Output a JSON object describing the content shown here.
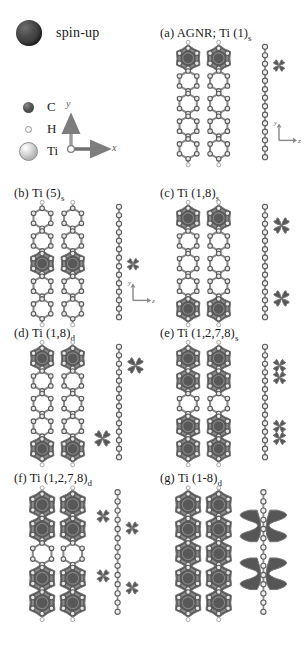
{
  "legend": {
    "spin_up_label": "spin-up",
    "atoms": [
      {
        "symbol": "C",
        "name": "carbon-marker"
      },
      {
        "symbol": "H",
        "name": "hydrogen-marker"
      },
      {
        "symbol": "Ti",
        "name": "titanium-marker"
      }
    ],
    "axes_main": {
      "x": "x",
      "y": "y"
    },
    "axes_side": {
      "y": "y",
      "z": "z"
    }
  },
  "colors": {
    "spin_density": "#4a4a4a",
    "spin_density_edge": "#6d6d6d",
    "carbon": "#4f4f4f",
    "hydrogen": "#f0f0f0",
    "titanium": "#c9c9c9",
    "bond": "#8a8a8a",
    "background": "#ffffff"
  },
  "panels": [
    {
      "id": "a",
      "tag": "(a)",
      "title_main": "AGNR; Ti (1)",
      "title_sub": "s",
      "full_label": "(a) AGNR; Ti (1)s",
      "ti_sites": [
        1
      ],
      "coupling": "s",
      "top_view_name": "top-view-a",
      "side_view_name": "side-view-a",
      "show_side_axes": true,
      "spin_positions_top": [
        {
          "col": 0,
          "row": 0
        },
        {
          "col": 1,
          "row": 0
        }
      ],
      "side_lobes": [
        {
          "y": 0.17,
          "side": "right",
          "size": "small"
        }
      ]
    },
    {
      "id": "b",
      "tag": "(b)",
      "title_main": "Ti (5)",
      "title_sub": "s",
      "full_label": "(b) Ti (5)s",
      "ti_sites": [
        5
      ],
      "coupling": "s",
      "top_view_name": "top-view-b",
      "side_view_name": "side-view-b",
      "show_side_axes": true,
      "spin_positions_top": [
        {
          "col": 0,
          "row": 2
        },
        {
          "col": 1,
          "row": 2
        }
      ],
      "side_lobes": [
        {
          "y": 0.52,
          "side": "right",
          "size": "small"
        }
      ]
    },
    {
      "id": "c",
      "tag": "(c)",
      "title_main": "Ti (1,8)",
      "title_sub": "s",
      "full_label": "(c) Ti (1,8)s",
      "ti_sites": [
        1,
        8
      ],
      "coupling": "s",
      "top_view_name": "top-view-c",
      "side_view_name": "side-view-c",
      "show_side_axes": false,
      "spin_positions_top": [
        {
          "col": 0,
          "row": 0
        },
        {
          "col": 1,
          "row": 0
        },
        {
          "col": 0,
          "row": 4
        },
        {
          "col": 1,
          "row": 4
        }
      ],
      "side_lobes": [
        {
          "y": 0.17,
          "side": "right",
          "size": "large"
        },
        {
          "y": 0.83,
          "side": "right",
          "size": "large"
        }
      ]
    },
    {
      "id": "d",
      "tag": "(d)",
      "title_main": "Ti (1,8)",
      "title_sub": "d",
      "full_label": "(d) Ti (1,8)d",
      "ti_sites": [
        1,
        8
      ],
      "coupling": "d",
      "top_view_name": "top-view-d",
      "side_view_name": "side-view-d",
      "show_side_axes": false,
      "spin_positions_top": [
        {
          "col": 0,
          "row": 0
        },
        {
          "col": 1,
          "row": 0
        },
        {
          "col": 0,
          "row": 4
        },
        {
          "col": 1,
          "row": 4
        }
      ],
      "side_lobes": [
        {
          "y": 0.17,
          "side": "right",
          "size": "large"
        },
        {
          "y": 0.83,
          "side": "left",
          "size": "large"
        }
      ]
    },
    {
      "id": "e",
      "tag": "(e)",
      "title_main": "Ti (1,2,7,8)",
      "title_sub": "s",
      "full_label": "(e) Ti (1,2,7,8)s",
      "ti_sites": [
        1,
        2,
        7,
        8
      ],
      "coupling": "s",
      "top_view_name": "top-view-e",
      "side_view_name": "side-view-e",
      "show_side_axes": false,
      "spin_positions_top": [
        {
          "col": 0,
          "row": 0
        },
        {
          "col": 1,
          "row": 0
        },
        {
          "col": 0,
          "row": 1
        },
        {
          "col": 1,
          "row": 1
        },
        {
          "col": 0,
          "row": 3
        },
        {
          "col": 1,
          "row": 3
        },
        {
          "col": 0,
          "row": 4
        },
        {
          "col": 1,
          "row": 4
        }
      ],
      "side_lobes": [
        {
          "y": 0.17,
          "side": "right",
          "size": "medium"
        },
        {
          "y": 0.28,
          "side": "right",
          "size": "medium"
        },
        {
          "y": 0.72,
          "side": "right",
          "size": "medium"
        },
        {
          "y": 0.83,
          "side": "right",
          "size": "medium"
        }
      ]
    },
    {
      "id": "f",
      "tag": "(f)",
      "title_main": "Ti (1,2,7,8)",
      "title_sub": "d",
      "full_label": "(f) Ti (1,2,7,8)d",
      "ti_sites": [
        1,
        2,
        7,
        8
      ],
      "coupling": "d",
      "top_view_name": "top-view-f",
      "side_view_name": "side-view-f",
      "show_side_axes": false,
      "spin_positions_top": [
        {
          "col": 0,
          "row": 0
        },
        {
          "col": 1,
          "row": 0
        },
        {
          "col": 0,
          "row": 1
        },
        {
          "col": 1,
          "row": 1
        },
        {
          "col": 0,
          "row": 3
        },
        {
          "col": 1,
          "row": 3
        },
        {
          "col": 0,
          "row": 4
        },
        {
          "col": 1,
          "row": 4
        }
      ],
      "side_lobes": [
        {
          "y": 0.2,
          "side": "left",
          "size": "medium"
        },
        {
          "y": 0.3,
          "side": "right",
          "size": "medium"
        },
        {
          "y": 0.7,
          "side": "left",
          "size": "medium"
        },
        {
          "y": 0.8,
          "side": "right",
          "size": "medium"
        }
      ]
    },
    {
      "id": "g",
      "tag": "(g)",
      "title_main": "Ti (1-8)",
      "title_sub": "d",
      "full_label": "(g) Ti (1-8)d",
      "ti_sites": [
        1,
        2,
        3,
        4,
        5,
        6,
        7,
        8
      ],
      "coupling": "d",
      "top_view_name": "top-view-g",
      "side_view_name": "side-view-g",
      "show_side_axes": false,
      "spin_positions_top": [
        {
          "col": 0,
          "row": 0
        },
        {
          "col": 1,
          "row": 0
        },
        {
          "col": 0,
          "row": 1
        },
        {
          "col": 1,
          "row": 1
        },
        {
          "col": 0,
          "row": 2
        },
        {
          "col": 1,
          "row": 2
        },
        {
          "col": 0,
          "row": 3
        },
        {
          "col": 1,
          "row": 3
        },
        {
          "col": 0,
          "row": 4
        },
        {
          "col": 1,
          "row": 4
        }
      ],
      "side_lobes": [
        {
          "y": 0.3,
          "side": "left",
          "size": "slab"
        },
        {
          "y": 0.3,
          "side": "right",
          "size": "slab"
        },
        {
          "y": 0.7,
          "side": "left",
          "size": "slab"
        },
        {
          "y": 0.7,
          "side": "right",
          "size": "slab"
        }
      ]
    }
  ]
}
